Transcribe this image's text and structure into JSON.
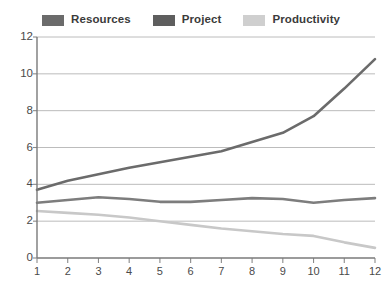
{
  "chart_data": {
    "type": "line",
    "title": "",
    "subtitle": "",
    "xlabel": "",
    "ylabel": "",
    "categories": [
      "1",
      "2",
      "3",
      "4",
      "5",
      "6",
      "7",
      "8",
      "9",
      "10",
      "11",
      "12"
    ],
    "x": [
      1,
      2,
      3,
      4,
      5,
      6,
      7,
      8,
      9,
      10,
      11,
      12
    ],
    "ylim": [
      0,
      12
    ],
    "xlim": [
      1,
      12
    ],
    "yticks": [
      0,
      2,
      4,
      6,
      8,
      10,
      12
    ],
    "ytick_labels": [
      "0",
      "2",
      "4",
      "6",
      "8",
      "10",
      "12"
    ],
    "xtick_labels": [
      "1",
      "2",
      "3",
      "4",
      "5",
      "6",
      "7",
      "8",
      "9",
      "10",
      "11",
      "12"
    ],
    "grid": true,
    "grid_axis": "y",
    "legend_position": "top",
    "series": [
      {
        "name": "Resources",
        "color": "#6b6b6b",
        "values": [
          3.7,
          4.2,
          4.55,
          4.9,
          5.2,
          5.5,
          5.8,
          6.3,
          6.8,
          7.7,
          9.2,
          10.8
        ]
      },
      {
        "name": "Project",
        "color": "#7d7d7d",
        "values": [
          3.0,
          3.15,
          3.3,
          3.2,
          3.05,
          3.05,
          3.15,
          3.25,
          3.2,
          3.0,
          3.15,
          3.25
        ]
      },
      {
        "name": "Productivity",
        "color": "#c8c8c8",
        "values": [
          2.55,
          2.45,
          2.35,
          2.2,
          2.0,
          1.8,
          1.6,
          1.45,
          1.3,
          1.2,
          0.85,
          0.55
        ]
      }
    ]
  },
  "legend": {
    "items": [
      {
        "label": "Resources",
        "color": "#6b6b6b"
      },
      {
        "label": "Project",
        "color": "#5e5e5e"
      },
      {
        "label": "Productivity",
        "color": "#cfcfcf"
      }
    ]
  },
  "axes": {
    "axis_color": "#7a7a7a",
    "grid_color": "#b4b4b4",
    "tick_color": "#8a8a8a"
  }
}
